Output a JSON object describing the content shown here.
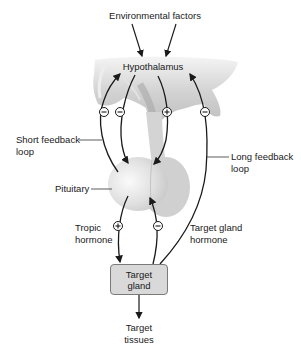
{
  "diagram": {
    "top_label": "Environmental factors",
    "hypothalamus_label": "Hypothalamus",
    "pituitary_label": "Pituitary",
    "short_loop_label": [
      "Short feedback",
      "loop"
    ],
    "long_loop_label": [
      "Long feedback",
      "loop"
    ],
    "tropic_label": [
      "Tropic",
      "hormone"
    ],
    "target_gland_hormone_label": [
      "Target gland",
      "hormone"
    ],
    "target_gland_box": [
      "Target",
      "gland"
    ],
    "target_tissues_label": [
      "Target",
      "tissues"
    ],
    "signs": {
      "short_loop_hypo": "−",
      "short_loop_pit": "−",
      "hypo_to_pit": "+",
      "long_loop": "−",
      "tropic": "+",
      "target_to_pit": "−"
    },
    "colors": {
      "tissue_light": "#e6e6e6",
      "tissue_mid": "#c8c8c8",
      "tissue_dark": "#b0b0b0",
      "box_fill": "#d9d9d9",
      "arrow": "#1a1a1a"
    }
  }
}
